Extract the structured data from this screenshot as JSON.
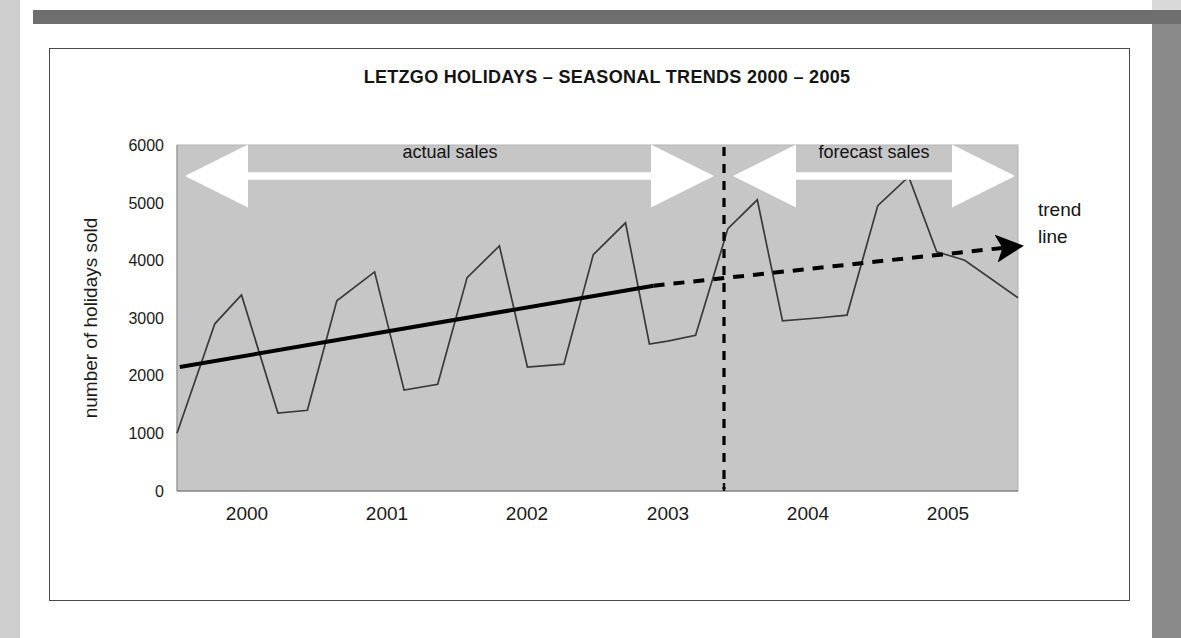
{
  "figure": {
    "title": "LETZGO HOLIDAYS – SEASONAL TRENDS 2000 – 2005",
    "trend_callout_line1": "trend",
    "trend_callout_line2": "line",
    "band_actual": "actual sales",
    "band_forecast": "forecast sales",
    "plot_bg": "#c6c6c6",
    "series_color": "#3a3a3a",
    "trend_color": "#000000",
    "divider_color": "#000000",
    "arrow_color": "#ffffff"
  },
  "chart_data": {
    "type": "line",
    "title": "LETZGO HOLIDAYS – SEASONAL TRENDS 2000 – 2005",
    "xlabel": "",
    "ylabel": "number of holidays sold",
    "ylim": [
      0,
      6000
    ],
    "xlim": [
      2000,
      2006
    ],
    "ytick_labels": [
      "0",
      "1000",
      "2000",
      "3000",
      "4000",
      "5000",
      "6000"
    ],
    "ytick_values": [
      0,
      1000,
      2000,
      3000,
      4000,
      5000,
      6000
    ],
    "xtick_labels": [
      "2000",
      "2001",
      "2002",
      "2003",
      "2004",
      "2005"
    ],
    "xtick_values": [
      2000.5,
      2001.5,
      2002.5,
      2003.5,
      2004.5,
      2005.5
    ],
    "grid": false,
    "legend": "none",
    "series": [
      {
        "name": "holidays sold",
        "style": "solid",
        "x": [
          2000.0,
          2000.27,
          2000.46,
          2000.72,
          2000.93,
          2001.14,
          2001.41,
          2001.62,
          2001.86,
          2002.07,
          2002.3,
          2002.5,
          2002.76,
          2002.97,
          2003.2,
          2003.37,
          2003.5,
          2003.7,
          2003.93,
          2004.14,
          2004.32,
          2004.57,
          2004.78,
          2005.0,
          2005.22,
          2005.42,
          2005.62,
          2006.0
        ],
        "values": [
          1000,
          2900,
          3400,
          1350,
          1400,
          3300,
          3800,
          1750,
          1850,
          3700,
          4250,
          2150,
          2200,
          4100,
          4650,
          2550,
          2600,
          2700,
          4550,
          5050,
          2950,
          3000,
          3050,
          4950,
          5450,
          4150,
          4000,
          3350
        ]
      },
      {
        "name": "trend line (actual)",
        "style": "solid-thick",
        "x": [
          2000.02,
          2003.4
        ],
        "values": [
          2150,
          3560
        ]
      },
      {
        "name": "trend line (forecast)",
        "style": "dashed-thick-arrow",
        "x": [
          2003.4,
          2006.0
        ],
        "values": [
          3560,
          4250
        ]
      }
    ],
    "annotations": [
      {
        "text": "actual sales",
        "x": 2001.7,
        "y": 5700,
        "kind": "band-label"
      },
      {
        "text": "forecast sales",
        "x": 2004.7,
        "y": 5700,
        "kind": "band-label"
      },
      {
        "text": "trend line",
        "x": 2006.1,
        "y": 4400,
        "kind": "callout"
      },
      {
        "text": "",
        "x": 2003.4,
        "y": 0,
        "kind": "vertical-divider-dashed"
      }
    ]
  },
  "geometry": {
    "plot_left": 177,
    "plot_right": 1018,
    "plot_top": 145,
    "plot_bottom": 491
  }
}
